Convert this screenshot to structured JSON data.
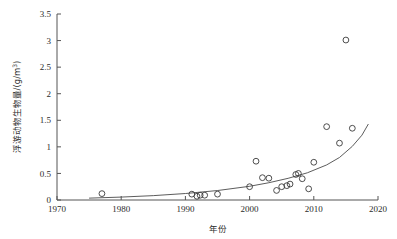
{
  "figure": {
    "background_color": "#ffffff",
    "axis_color": "#555555",
    "marker_color": "#3a3a3a",
    "curve_color": "#4a4a4a"
  },
  "axis": {
    "x_title": "年份",
    "y_title_main": "浮游动物生物量/(g/m",
    "y_title_sup": "3",
    "y_title_tail": ")",
    "x_ticks": [
      "1970",
      "1980",
      "1990",
      "2000",
      "2010",
      "2020"
    ],
    "y_ticks": [
      "0",
      "0.5",
      "1",
      "1.5",
      "2",
      "2.5",
      "3",
      "3.5"
    ]
  },
  "chart_data": {
    "type": "scatter",
    "title": "",
    "subtitle": "",
    "xlabel": "年份",
    "ylabel": "浮游动物生物量/(g/m3)",
    "xlim": [
      1970,
      2020
    ],
    "ylim": [
      0,
      3.5
    ],
    "xticks": [
      1970,
      1980,
      1990,
      2000,
      2010,
      2020
    ],
    "yticks": [
      0,
      0.5,
      1,
      1.5,
      2,
      2.5,
      3,
      3.5
    ],
    "grid": false,
    "legend": null,
    "legend_position": "none",
    "marker": "open-circle",
    "points": [
      {
        "x": 1977.0,
        "y": 0.12
      },
      {
        "x": 1991.0,
        "y": 0.11
      },
      {
        "x": 1991.8,
        "y": 0.07
      },
      {
        "x": 1992.3,
        "y": 0.09
      },
      {
        "x": 1993.0,
        "y": 0.09
      },
      {
        "x": 1995.0,
        "y": 0.11
      },
      {
        "x": 2000.0,
        "y": 0.25
      },
      {
        "x": 2001.0,
        "y": 0.73
      },
      {
        "x": 2002.0,
        "y": 0.42
      },
      {
        "x": 2003.0,
        "y": 0.41
      },
      {
        "x": 2004.2,
        "y": 0.18
      },
      {
        "x": 2005.0,
        "y": 0.25
      },
      {
        "x": 2005.8,
        "y": 0.27
      },
      {
        "x": 2006.3,
        "y": 0.3
      },
      {
        "x": 2007.2,
        "y": 0.48
      },
      {
        "x": 2007.6,
        "y": 0.5
      },
      {
        "x": 2008.2,
        "y": 0.4
      },
      {
        "x": 2009.2,
        "y": 0.21
      },
      {
        "x": 2010.0,
        "y": 0.71
      },
      {
        "x": 2012.0,
        "y": 1.38
      },
      {
        "x": 2014.0,
        "y": 1.07
      },
      {
        "x": 2015.0,
        "y": 3.01
      },
      {
        "x": 2016.0,
        "y": 1.35
      }
    ],
    "fit_curve": {
      "name": "exponential-trend",
      "description": "exponential fit of zooplankton biomass vs year",
      "x_start": 1975,
      "x_end": 2018.5,
      "points": [
        {
          "x": 1975.0,
          "y": 0.035
        },
        {
          "x": 1980.0,
          "y": 0.055
        },
        {
          "x": 1985.0,
          "y": 0.082
        },
        {
          "x": 1990.0,
          "y": 0.122
        },
        {
          "x": 1995.0,
          "y": 0.178
        },
        {
          "x": 2000.0,
          "y": 0.258
        },
        {
          "x": 2003.0,
          "y": 0.325
        },
        {
          "x": 2006.0,
          "y": 0.408
        },
        {
          "x": 2009.0,
          "y": 0.512
        },
        {
          "x": 2012.0,
          "y": 0.66
        },
        {
          "x": 2014.0,
          "y": 0.8
        },
        {
          "x": 2016.0,
          "y": 1.01
        },
        {
          "x": 2017.5,
          "y": 1.22
        },
        {
          "x": 2018.5,
          "y": 1.43
        }
      ]
    }
  }
}
